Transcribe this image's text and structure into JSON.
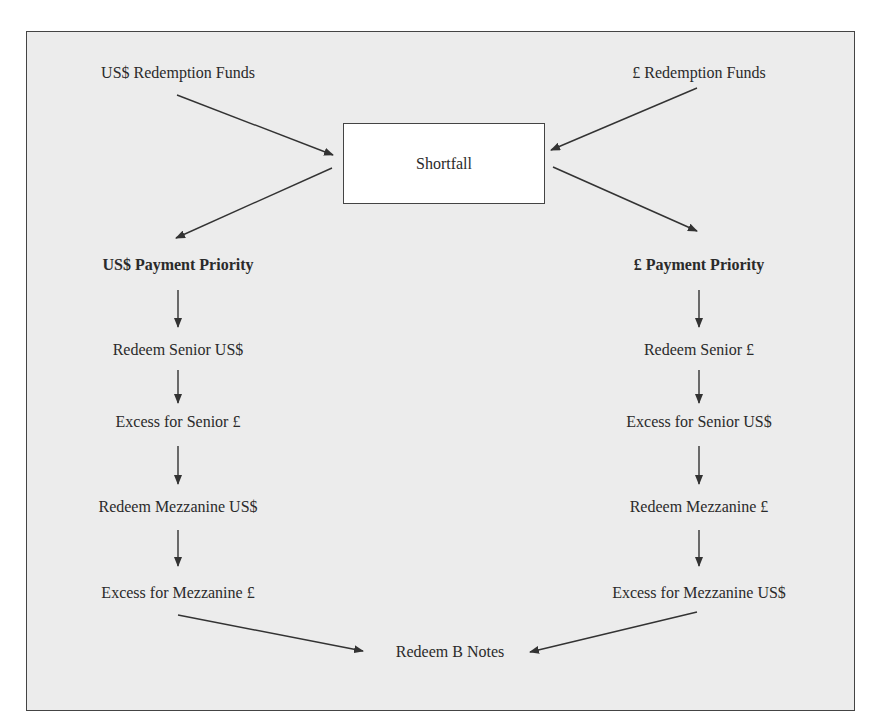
{
  "diagram": {
    "title_box": {
      "label": "Shortfall"
    },
    "inputs": {
      "left": "US$ Redemption Funds",
      "right": "£ Redemption Funds"
    },
    "left_column": {
      "header": "US$ Payment Priority",
      "steps": [
        "Redeem Senior US$",
        "Excess for Senior £",
        "Redeem Mezzanine US$",
        "Excess for Mezzanine £"
      ]
    },
    "right_column": {
      "header": "£ Payment Priority",
      "steps": [
        "Redeem Senior £",
        "Excess for Senior US$",
        "Redeem Mezzanine £",
        "Excess for Mezzanine US$"
      ]
    },
    "final": "Redeem B Notes",
    "colors": {
      "frame_bg": "#ececec",
      "box_bg": "#ffffff",
      "stroke": "#333333"
    }
  }
}
